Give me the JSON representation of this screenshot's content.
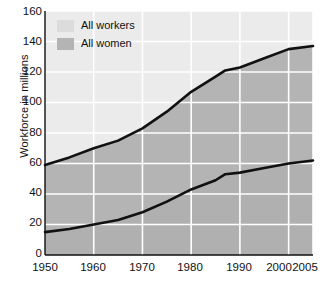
{
  "chart_data": {
    "type": "area",
    "title": "",
    "subtitle": "",
    "xlabel": "",
    "ylabel": "Workforce in millions",
    "xlim": [
      1950,
      2005
    ],
    "ylim": [
      0,
      160
    ],
    "ytick_labels": [
      "160",
      "140",
      "120",
      "100",
      "80",
      "60",
      "40",
      "20",
      "0"
    ],
    "ytick_values": [
      160,
      140,
      120,
      100,
      80,
      60,
      40,
      20,
      0
    ],
    "xtick_labels": [
      "1950",
      "1960",
      "1970",
      "1980",
      "1990",
      "2000",
      "2005"
    ],
    "xtick_values": [
      1950,
      1960,
      1970,
      1980,
      1990,
      2000,
      2005
    ],
    "grid": true,
    "grid_color": "#ffffff",
    "legend_position": "top-left",
    "legend": [
      "All workers",
      "All women"
    ],
    "x": [
      1950,
      1955,
      1960,
      1965,
      1970,
      1975,
      1980,
      1985,
      1987,
      1990,
      1995,
      2000,
      2005
    ],
    "series": [
      {
        "name": "All workers",
        "fill_color": "#ebebeb",
        "line_color": "#111111",
        "values": [
          59,
          64,
          70,
          75,
          83,
          94,
          107,
          117,
          121,
          123,
          129,
          135,
          137
        ]
      },
      {
        "name": "All women",
        "fill_color": "#b4b4b4",
        "line_color": "#111111",
        "values": [
          15,
          17,
          20,
          23,
          28,
          35,
          43,
          49,
          53,
          54,
          57,
          60,
          62
        ]
      }
    ],
    "band_below_women_color": "#b4b4b4"
  },
  "legend": {
    "items": [
      {
        "label": "All workers",
        "swatch_color": "#dcdcdc",
        "swatch_name": "legend-swatch-all-workers"
      },
      {
        "label": "All women",
        "swatch_color": "#b4b4b4",
        "swatch_name": "legend-swatch-all-women"
      }
    ]
  },
  "axes": {
    "y_title": "Workforce in millions",
    "y_ticks": [
      "160",
      "140",
      "120",
      "100",
      "80",
      "60",
      "40",
      "20",
      "0"
    ],
    "x_ticks": [
      "1950",
      "1960",
      "1970",
      "1980",
      "1990",
      "2000",
      "2005"
    ]
  }
}
